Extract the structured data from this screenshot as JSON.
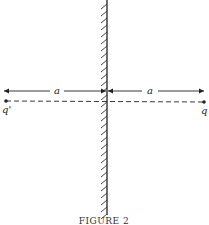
{
  "figure": {
    "caption": "FIGURE 2",
    "distance_left_label": "a",
    "distance_right_label": "a",
    "image_charge_label": "q'",
    "charge_label": "q"
  },
  "colors": {
    "ink": "#222222",
    "background": "#ffffff"
  }
}
